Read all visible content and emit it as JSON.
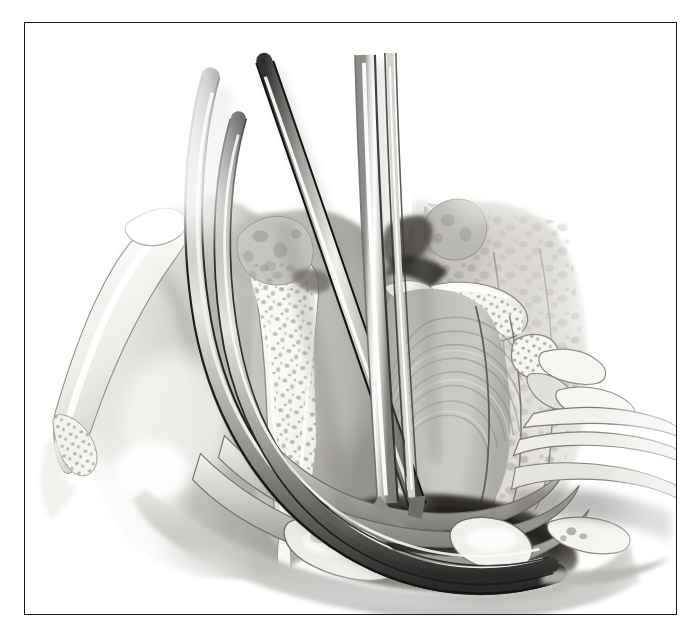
{
  "figure": {
    "domain_type": "anatomical-illustration",
    "medium": "grayscale airbrush medical illustration",
    "frame": {
      "border_color": "#1b1b1b",
      "border_width_px": 1.6,
      "left": 24,
      "top": 22,
      "width": 653,
      "height": 593
    },
    "background_color": "#ffffff",
    "subject": "sagittal cut-away view of the upper airway during endoscopic instrumentation",
    "visible_text": [],
    "labels": [],
    "palette": {
      "paper_white": "#ffffff",
      "bone_white": "#f4f3f0",
      "bone_shadow": "#cfcdc8",
      "trabecula": "#9e9c97",
      "soft_tissue_light": "#d8d6d2",
      "soft_tissue_mid": "#b4b2ad",
      "soft_tissue_dark": "#8d8b87",
      "cavity_shadow": "#4a4845",
      "deep_shadow": "#2a2927",
      "instrument_highlight": "#fbfbfb",
      "instrument_mid": "#bdbcb8",
      "instrument_outline": "#141414",
      "frame_line": "#1b1b1b"
    },
    "instruments": [
      {
        "name": "curved-flexible-endoscope",
        "description": "long dark curved tube entering from upper-left, sweeping down and to the right along the floor of the cavity",
        "entry_point": [
          205,
          72
        ],
        "tip_point": [
          560,
          545
        ],
        "shade": "dark-outlined gray tube",
        "stroke_width_px": 14
      },
      {
        "name": "straight-rigid-instrument",
        "description": "straight tapered rigid shaft entering from the top center, angled down and to the right",
        "entry_point": [
          252,
          60
        ],
        "tip_point": [
          392,
          492
        ],
        "shade": "mid-gray with bright specular highlight",
        "stroke_width_px": 12
      },
      {
        "name": "vertical-suction-cannula",
        "description": "near-vertical bright tapered cannula entering top center-right ending at the tissue edge",
        "entry_point": [
          345,
          86
        ],
        "tip_point": [
          380,
          480
        ],
        "shade": "light gray with white highlight stripe",
        "stroke_width_px": 16
      }
    ],
    "anatomy": [
      {
        "name": "anterior-soft-tissue-flap",
        "region": "left",
        "description": "pale soft tissue wall with thin cartilage rim along its upper-left border"
      },
      {
        "name": "left-bone-segment",
        "region": "center-left",
        "description": "wedge of cancellous bone with visible trabecular spaces, white with gray pores"
      },
      {
        "name": "right-bone-segment",
        "region": "center-right",
        "description": "horizontal cancellous bone spur projecting left from the right wall"
      },
      {
        "name": "posterior-wall-striated-tissue",
        "region": "center-right",
        "description": "large striated muscular wall with concentric fibre rings"
      },
      {
        "name": "dark-recess-cavity",
        "region": "lower-center",
        "description": "deep shadowed recess beneath the instruments"
      },
      {
        "name": "inferior-mucosal-folds",
        "region": "bottom",
        "description": "stacked curved mucosal folds sweeping from lower-left to lower-right"
      },
      {
        "name": "right-cartilage-rings",
        "region": "lower-right",
        "description": "pale cartilage bands curving toward the right margin"
      }
    ]
  }
}
